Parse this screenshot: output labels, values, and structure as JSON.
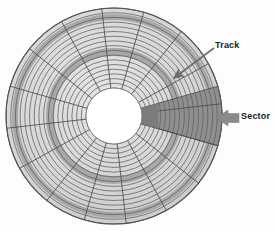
{
  "figure": {
    "background_color": "#fdfdfd"
  },
  "disk": {
    "center_x": 114,
    "center_y": 116,
    "outer_radius": 108,
    "hub_radius": 28,
    "track_count": 17,
    "sector_count": 16,
    "platter_fill": "#d8d8d8",
    "track_line_color": "#5e5e5e",
    "band_fill": "#a8a8a8",
    "sector_divider_color": "#4d4d4d",
    "hub_fill": "#ffffff",
    "outline_color": "#3f3f3f",
    "highlight_sector": {
      "start_angle_deg": -16,
      "end_angle_deg": 16,
      "fill": "#8f8f8f",
      "inner_wedge_fill": "#7c7c7c"
    },
    "dark_bands": [
      {
        "inner_radius": 60,
        "outer_radius": 68
      },
      {
        "inner_radius": 96,
        "outer_radius": 102
      }
    ]
  },
  "annotations": {
    "track": {
      "label": "Track",
      "arrow_from_x": 214,
      "arrow_from_y": 48,
      "arrow_to_x": 174,
      "arrow_to_y": 78,
      "arrow_color": "#6d6d6d"
    },
    "sector": {
      "label": "Sector",
      "arrow_from_x": 239,
      "arrow_from_y": 118,
      "arrow_to_x": 216,
      "arrow_to_y": 118,
      "arrow_color": "#8a8a8a"
    }
  }
}
